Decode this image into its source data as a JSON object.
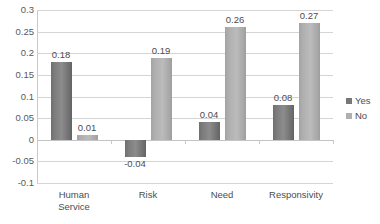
{
  "chart_data": {
    "type": "bar",
    "title": "",
    "subtitle": "",
    "xlabel": "",
    "ylabel": "",
    "categories": [
      "Human\nService",
      "Risk",
      "Need",
      "Responsivity"
    ],
    "series": [
      {
        "name": "Yes",
        "color": "#7d7d7d",
        "values": [
          0.18,
          -0.04,
          0.04,
          0.08
        ]
      },
      {
        "name": "No",
        "color": "#b0b0b0",
        "values": [
          0.01,
          0.19,
          0.26,
          0.27
        ]
      }
    ],
    "data_labels": [
      [
        "0.18",
        "-0.04",
        "0.04",
        "0.08"
      ],
      [
        "0.01",
        "0.19",
        "0.26",
        "0.27"
      ]
    ],
    "ylim": [
      -0.1,
      0.3
    ],
    "ytick_labels": [
      "0.3",
      "0.25",
      "0.2",
      "0.15",
      "0.1",
      "0.05",
      "0",
      "-0.05",
      "-0.1"
    ],
    "ytick_values": [
      0.3,
      0.25,
      0.2,
      0.15,
      0.1,
      0.05,
      0,
      -0.05,
      -0.1
    ],
    "grid": true,
    "legend_position": "right",
    "legend": [
      "Yes",
      "No"
    ]
  }
}
